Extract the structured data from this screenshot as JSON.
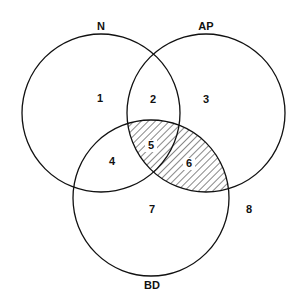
{
  "diagram": {
    "type": "venn",
    "sets": [
      {
        "id": "N",
        "label": "N",
        "cx": 101,
        "cy": 113,
        "r": 79,
        "label_x": 101,
        "label_y": 30
      },
      {
        "id": "AP",
        "label": "AP",
        "cx": 206,
        "cy": 113,
        "r": 79,
        "label_x": 206,
        "label_y": 30
      },
      {
        "id": "BD",
        "label": "BD",
        "cx": 151,
        "cy": 198,
        "r": 78,
        "label_x": 152,
        "label_y": 289
      }
    ],
    "regions": [
      {
        "label": "1",
        "x": 100,
        "y": 102
      },
      {
        "label": "2",
        "x": 153,
        "y": 103
      },
      {
        "label": "3",
        "x": 206,
        "y": 103
      },
      {
        "label": "4",
        "x": 112,
        "y": 165
      },
      {
        "label": "5",
        "x": 151,
        "y": 149
      },
      {
        "label": "6",
        "x": 189,
        "y": 167
      },
      {
        "label": "7",
        "x": 152,
        "y": 213
      },
      {
        "label": "8",
        "x": 249,
        "y": 213
      }
    ],
    "shaded": "AP ∩ BD (regions 5, 6)",
    "colors": {
      "stroke": "#111111",
      "hatch": "#111111",
      "background": "#ffffff"
    }
  }
}
